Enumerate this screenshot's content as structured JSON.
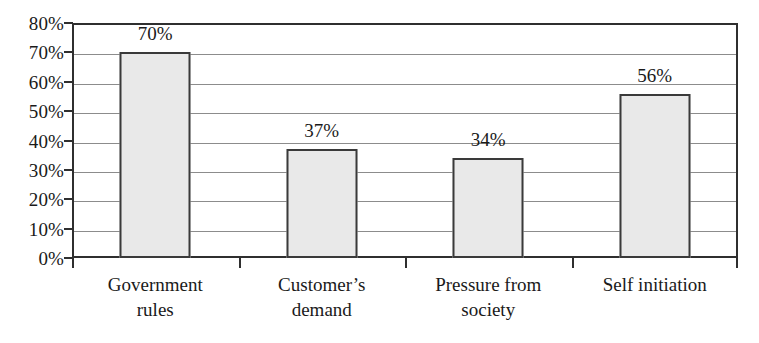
{
  "chart_data": {
    "type": "bar",
    "title": "",
    "subtitle": "",
    "xlabel": "",
    "ylabel": "",
    "categories": [
      "Government rules",
      "Customer’s demand",
      "Pressure from society",
      "Self initiation"
    ],
    "category_lines": [
      [
        "Government",
        "rules"
      ],
      [
        "Customer’s",
        "demand"
      ],
      [
        "Pressure from",
        "society"
      ],
      [
        "Self initiation"
      ]
    ],
    "values": [
      70,
      37,
      34,
      56
    ],
    "data_labels": [
      "70%",
      "37%",
      "34%",
      "56%"
    ],
    "ylim": [
      0,
      80
    ],
    "ytick_values": [
      0,
      10,
      20,
      30,
      40,
      50,
      60,
      70,
      80
    ],
    "ytick_labels": [
      "0%",
      "10%",
      "20%",
      "30%",
      "40%",
      "50%",
      "60%",
      "70%",
      "80%"
    ],
    "grid": true,
    "grid_axis": "y",
    "legend": false,
    "legend_position": "none",
    "bar_fill_color": "#e9e9e9",
    "bar_border_color": "#3a3a3a",
    "gridline_color": "#8c8c8c",
    "axis_color": "#2f2f2f",
    "text_color": "#1a1a1a",
    "background_color": "#ffffff"
  }
}
